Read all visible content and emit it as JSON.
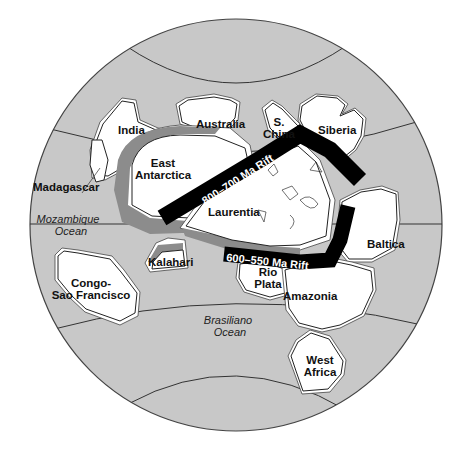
{
  "map": {
    "type": "paleogeographic globe reconstruction (Rodinia breakup)",
    "colors": {
      "ocean": "#c8c8c8",
      "land": "#ffffff",
      "rifted_margin": "#8c8c8c",
      "rift_band": "#000000",
      "outline": "#222222"
    },
    "continents": [
      {
        "id": "india",
        "label": "India"
      },
      {
        "id": "australia",
        "label": "Australia"
      },
      {
        "id": "s-china",
        "label_line1": "S.",
        "label_line2": "China"
      },
      {
        "id": "siberia",
        "label": "Siberia"
      },
      {
        "id": "madagascar",
        "label": "Madagascar"
      },
      {
        "id": "east-antarctica",
        "label_line1": "East",
        "label_line2": "Antarctica"
      },
      {
        "id": "laurentia",
        "label": "Laurentia"
      },
      {
        "id": "baltica",
        "label": "Baltica"
      },
      {
        "id": "kalahari",
        "label": "Kalahari"
      },
      {
        "id": "congo-sao-francisco",
        "label_line1": "Congo-",
        "label_line2": "Sao Francisco"
      },
      {
        "id": "rio-plata",
        "label_line1": "Rio",
        "label_line2": "Plata"
      },
      {
        "id": "amazonia",
        "label": "Amazonia"
      },
      {
        "id": "west-africa",
        "label_line1": "West",
        "label_line2": "Africa"
      }
    ],
    "oceans": [
      {
        "id": "mozambique-ocean",
        "label_line1": "Mozambique",
        "label_line2": "Ocean"
      },
      {
        "id": "brasiliano-ocean",
        "label_line1": "Brasiliano",
        "label_line2": "Ocean"
      }
    ],
    "rifts": [
      {
        "id": "rift-800-700",
        "label": "800–700 Ma Rift"
      },
      {
        "id": "rift-600-550",
        "label": "600–550 Ma Rift"
      }
    ]
  }
}
